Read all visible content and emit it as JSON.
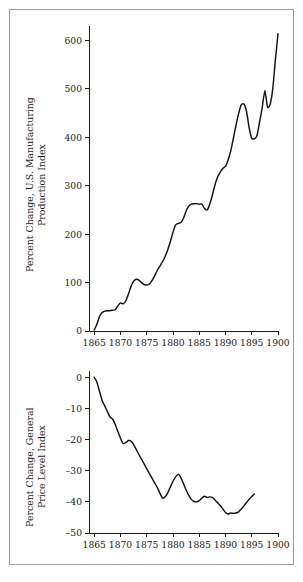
{
  "figure": {
    "background_color": "#ffffff",
    "frame_color": "#9a9a9a",
    "line_color": "#111111"
  },
  "chart_data": [
    {
      "id": "manufacturing-production",
      "type": "line",
      "title": "",
      "xlabel": "",
      "ylabel": "Percent Change, U.S. Manufacturing\nProduction Index",
      "xlim": [
        1864,
        1900
      ],
      "ylim": [
        0,
        630
      ],
      "xticks": [
        1865,
        1870,
        1875,
        1880,
        1885,
        1890,
        1895,
        1900
      ],
      "xtick_labels": [
        "1865",
        "1870",
        "1875",
        "1880",
        "1885",
        "1890",
        "1895",
        "1900"
      ],
      "yticks": [
        0,
        100,
        200,
        300,
        400,
        500,
        600
      ],
      "ytick_labels": [
        "0",
        "100",
        "200",
        "300",
        "400",
        "500",
        "600"
      ],
      "grid": false,
      "legend": "none",
      "x": [
        1865,
        1865.5,
        1866,
        1866.5,
        1867,
        1867.5,
        1868,
        1868.5,
        1869,
        1869.5,
        1870,
        1870.5,
        1871,
        1871.5,
        1872,
        1872.5,
        1873,
        1873.5,
        1874,
        1874.5,
        1875,
        1875.5,
        1876,
        1876.5,
        1877,
        1877.5,
        1878,
        1878.5,
        1879,
        1879.5,
        1880,
        1880.5,
        1881,
        1881.5,
        1882,
        1882.5,
        1883,
        1883.5,
        1884,
        1884.5,
        1885,
        1885.5,
        1886,
        1886.5,
        1887,
        1887.5,
        1888,
        1888.5,
        1889,
        1889.5,
        1890,
        1890.5,
        1891,
        1891.5,
        1892,
        1892.5,
        1893,
        1893.5,
        1894,
        1894.5,
        1895,
        1895.5,
        1896,
        1896.5,
        1897,
        1897.5,
        1898,
        1898.5,
        1899,
        1899.5,
        1900
      ],
      "values": [
        2,
        14,
        30,
        38,
        41,
        42,
        42,
        43,
        44,
        52,
        58,
        56,
        62,
        76,
        92,
        103,
        107,
        105,
        100,
        96,
        95,
        97,
        104,
        114,
        125,
        134,
        143,
        154,
        168,
        185,
        204,
        219,
        222,
        224,
        233,
        248,
        258,
        262,
        263,
        263,
        262,
        262,
        253,
        250,
        262,
        281,
        302,
        318,
        328,
        336,
        340,
        353,
        372,
        398,
        425,
        449,
        467,
        469,
        454,
        420,
        398,
        397,
        404,
        432,
        462,
        497,
        462,
        468,
        500,
        560,
        614
      ]
    },
    {
      "id": "general-price-level",
      "type": "line",
      "title": "",
      "xlabel": "",
      "ylabel": "Percent Change, General\nPrice Level Index",
      "xlim": [
        1864,
        1900
      ],
      "ylim": [
        -50,
        2
      ],
      "xticks": [
        1865,
        1870,
        1875,
        1880,
        1885,
        1890,
        1895,
        1900
      ],
      "xtick_labels": [
        "1865",
        "1870",
        "1875",
        "1880",
        "1885",
        "1890",
        "1895",
        "1900"
      ],
      "yticks": [
        0,
        -10,
        -20,
        -30,
        -40,
        -50
      ],
      "ytick_labels": [
        "0",
        "–10",
        "–20",
        "–30",
        "–40",
        "–50"
      ],
      "grid": false,
      "legend": "none",
      "x": [
        1865,
        1865.5,
        1866,
        1866.5,
        1867,
        1867.5,
        1868,
        1868.5,
        1869,
        1869.5,
        1870,
        1870.5,
        1871,
        1871.5,
        1872,
        1872.5,
        1873,
        1873.5,
        1874,
        1874.5,
        1875,
        1875.5,
        1876,
        1876.5,
        1877,
        1877.5,
        1878,
        1878.5,
        1879,
        1879.5,
        1880,
        1880.5,
        1881,
        1881.5,
        1882,
        1882.5,
        1883,
        1883.5,
        1884,
        1884.5,
        1885,
        1885.5,
        1886,
        1886.5,
        1887,
        1887.5,
        1888,
        1888.5,
        1889,
        1889.5,
        1890,
        1890.5,
        1891,
        1891.5,
        1892,
        1892.5,
        1893,
        1893.5,
        1894,
        1894.5,
        1895,
        1895.5,
        1896,
        1896.5,
        1897,
        1897.5,
        1898,
        1898.5,
        1899,
        1899.5,
        1900
      ],
      "values": [
        0,
        -1.5,
        -4.5,
        -7.5,
        -9.2,
        -11.0,
        -12.8,
        -13.4,
        -15.2,
        -17.4,
        -19.6,
        -21.3,
        -21.0,
        -20.3,
        -20.5,
        -21.6,
        -23.2,
        -24.8,
        -26.3,
        -27.8,
        -29.4,
        -30.9,
        -32.4,
        -33.9,
        -35.4,
        -37.2,
        -38.8,
        -38.4,
        -37.1,
        -35.2,
        -33.4,
        -32.0,
        -31.1,
        -32.2,
        -34.2,
        -36.2,
        -37.9,
        -39.2,
        -39.9,
        -40.0,
        -39.6,
        -38.8,
        -38.2,
        -38.6,
        -38.4,
        -38.6,
        -39.4,
        -40.3,
        -41.2,
        -42.3,
        -43.4,
        -43.9,
        -43.6,
        -43.7,
        -43.6,
        -43.2,
        -42.3,
        -41.3,
        -40.2,
        -39.2,
        -38.3,
        -37.5,
        -36.9
      ]
    }
  ]
}
